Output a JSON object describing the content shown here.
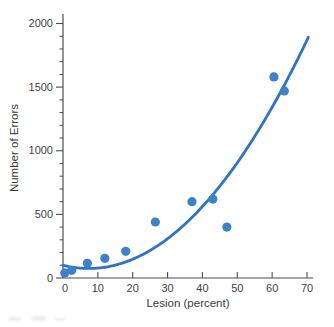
{
  "chart_data": {
    "type": "scatter",
    "title": "",
    "xlabel": "Lesion (percent)",
    "ylabel": "Number of Errors",
    "xlim": [
      0,
      70
    ],
    "ylim": [
      0,
      2000
    ],
    "x_ticks": [
      0,
      10,
      20,
      30,
      40,
      50,
      60,
      70
    ],
    "y_ticks": [
      0,
      500,
      1000,
      1500,
      2000
    ],
    "y_minor_step": 100,
    "grid": false,
    "legend": false,
    "points": [
      [
        0.5,
        40
      ],
      [
        2.5,
        60
      ],
      [
        7,
        115
      ],
      [
        12,
        155
      ],
      [
        18,
        210
      ],
      [
        26.5,
        440
      ],
      [
        37,
        600
      ],
      [
        43,
        620
      ],
      [
        47,
        400
      ],
      [
        60.5,
        1580
      ],
      [
        63.5,
        1470
      ]
    ],
    "trend": {
      "type": "quadratic",
      "coeffs": [
        100,
        -6.78,
        0.458
      ],
      "x_range": [
        0,
        70.4
      ],
      "description": "fitted curve dipping to ~75 errors near 7% lesion then rising to ~1880 at 70%"
    },
    "colors": {
      "point": "#3b82cb",
      "line": "#2e74c6",
      "axis": "#4d4d4d",
      "text": "#3a3a3a"
    }
  }
}
